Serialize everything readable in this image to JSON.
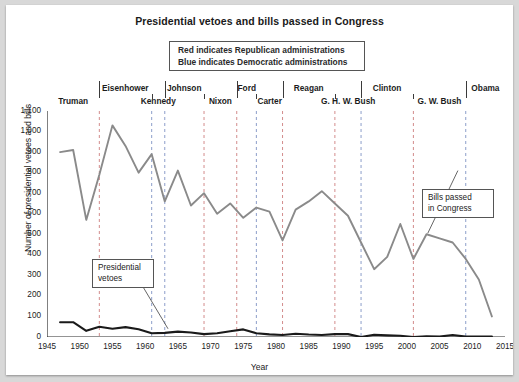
{
  "chart_data": {
    "type": "line",
    "title": "Presidential vetoes and bills passed in Congress",
    "xlabel": "Year",
    "ylabel": "Number of presidential vetoes and bills",
    "xlim": [
      1945,
      2015
    ],
    "ylim": [
      0,
      1100
    ],
    "ytick_step": 100,
    "xtick_step": 5,
    "grid": false,
    "legend_position": "top-center",
    "xticks": [
      "1945",
      "1950",
      "1955",
      "1960",
      "1965",
      "1970",
      "1975",
      "1980",
      "1985",
      "1990",
      "1995",
      "2000",
      "2005",
      "2010",
      "2015"
    ],
    "yticks": [
      "0",
      "100",
      "200",
      "300",
      "400",
      "500",
      "600",
      "700",
      "800",
      "900",
      "1,000",
      "1,100"
    ],
    "legend": [
      "Red indicates Republican administrations",
      "Blue indicates Democratic administrations"
    ],
    "annotations": [
      {
        "name": "presidential-vetoes",
        "text_line1": "Presidential",
        "text_line2": "vetoes"
      },
      {
        "name": "bills-passed",
        "text_line1": "Bills passed",
        "text_line2": "in Congress"
      }
    ],
    "administrations": [
      {
        "name": "Truman",
        "party": "Democratic",
        "start": 1945,
        "end": 1953,
        "row": "bottom"
      },
      {
        "name": "Eisenhower",
        "party": "Republican",
        "start": 1953,
        "end": 1961,
        "row": "top"
      },
      {
        "name": "Kennedy",
        "party": "Democratic",
        "start": 1961,
        "end": 1963,
        "row": "bottom"
      },
      {
        "name": "Johnson",
        "party": "Democratic",
        "start": 1963,
        "end": 1969,
        "row": "top"
      },
      {
        "name": "Nixon",
        "party": "Republican",
        "start": 1969,
        "end": 1974,
        "row": "bottom"
      },
      {
        "name": "Ford",
        "party": "Republican",
        "start": 1974,
        "end": 1977,
        "row": "top"
      },
      {
        "name": "Carter",
        "party": "Democratic",
        "start": 1977,
        "end": 1981,
        "row": "bottom"
      },
      {
        "name": "Reagan",
        "party": "Republican",
        "start": 1981,
        "end": 1989,
        "row": "top"
      },
      {
        "name": "G. H. W. Bush",
        "party": "Republican",
        "start": 1989,
        "end": 1993,
        "row": "bottom"
      },
      {
        "name": "Clinton",
        "party": "Democratic",
        "start": 1993,
        "end": 2001,
        "row": "top"
      },
      {
        "name": "G. W. Bush",
        "party": "Republican",
        "start": 2001,
        "end": 2009,
        "row": "bottom"
      },
      {
        "name": "Obama",
        "party": "Democratic",
        "start": 2009,
        "end": 2015,
        "row": "top"
      }
    ],
    "series": [
      {
        "name": "Bills passed in Congress",
        "x": [
          1947,
          1949,
          1951,
          1953,
          1955,
          1957,
          1959,
          1961,
          1963,
          1965,
          1967,
          1969,
          1971,
          1973,
          1975,
          1977,
          1979,
          1981,
          1983,
          1985,
          1987,
          1989,
          1991,
          1993,
          1995,
          1997,
          1999,
          2001,
          2003,
          2005,
          2007,
          2009,
          2011,
          2013
        ],
        "values": [
          900,
          910,
          570,
          790,
          1030,
          930,
          800,
          890,
          660,
          810,
          640,
          700,
          600,
          650,
          580,
          630,
          610,
          470,
          620,
          660,
          710,
          650,
          590,
          460,
          330,
          390,
          550,
          380,
          500,
          480,
          460,
          380,
          280,
          100
        ]
      },
      {
        "name": "Presidential vetoes",
        "x": [
          1947,
          1949,
          1951,
          1953,
          1955,
          1957,
          1959,
          1961,
          1963,
          1965,
          1967,
          1969,
          1971,
          1973,
          1975,
          1977,
          1979,
          1981,
          1983,
          1985,
          1987,
          1989,
          1991,
          1993,
          1995,
          1997,
          1999,
          2001,
          2003,
          2005,
          2007,
          2009,
          2011,
          2013
        ],
        "values": [
          72,
          72,
          30,
          50,
          40,
          48,
          38,
          18,
          20,
          26,
          22,
          14,
          18,
          28,
          37,
          18,
          13,
          10,
          16,
          12,
          10,
          14,
          14,
          0,
          11,
          8,
          6,
          0,
          4,
          2,
          10,
          2,
          2,
          2
        ]
      }
    ]
  },
  "styles": {
    "line_color": "#8a8a8a",
    "veto_line_color": "#1a1a1a",
    "republican_color": "#b03030",
    "democratic_color": "#3050a0",
    "divider_color": "#9a9a9a",
    "axis_color": "#2a2a2a",
    "page_bg": "#ffffff",
    "canvas_bg": "#d8d8d8"
  }
}
